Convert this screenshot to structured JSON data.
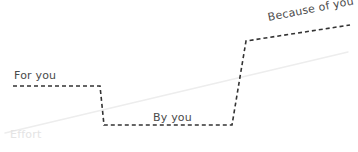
{
  "canvas": {
    "width": 358,
    "height": 152,
    "background": "#ffffff"
  },
  "colors": {
    "step_line": "#333333",
    "trend_line": "#ededed",
    "label_text": "#4a4a4a",
    "faint_text": "#e4e4e4"
  },
  "labels": {
    "for_you": "For you",
    "by_you": "By you",
    "because_of_you": "Because of you",
    "effort": "Effort"
  },
  "chart_data": {
    "type": "line",
    "title": "",
    "xlabel": "Effort",
    "ylabel": "",
    "grid": false,
    "legend": "none",
    "series": [
      {
        "name": "Step progression",
        "style": "dashed",
        "color": "#333333",
        "points": [
          [
            13,
            86
          ],
          [
            100,
            86
          ],
          [
            104,
            125
          ],
          [
            232,
            125
          ],
          [
            246,
            41
          ],
          [
            350,
            25
          ]
        ]
      },
      {
        "name": "Effort",
        "style": "solid",
        "color": "#ededed",
        "points": [
          [
            5,
            133
          ],
          [
            348,
            52
          ]
        ]
      }
    ],
    "annotations": [
      {
        "text": "For you",
        "x": 14,
        "y": 78,
        "rotation": 0
      },
      {
        "text": "By you",
        "x": 153,
        "y": 120,
        "rotation": 0
      },
      {
        "text": "Because of you",
        "x": 269,
        "y": 20,
        "rotation": -11
      },
      {
        "text": "Effort",
        "x": 10,
        "y": 137,
        "rotation": 0
      }
    ]
  }
}
